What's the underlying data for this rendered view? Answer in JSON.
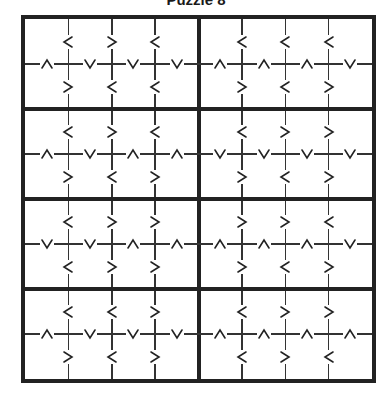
{
  "title": "Puzzle 8",
  "puzzle_type": "greater-than-sudoku",
  "grid": {
    "rows": 8,
    "cols": 8,
    "box_rows": 2,
    "box_cols": 4,
    "line_color": "#333333",
    "border_color": "#222222"
  },
  "boxes": [
    {
      "box": 1,
      "rows": [
        1,
        2
      ],
      "cols": [
        1,
        4
      ],
      "h_top": [
        "<",
        ">",
        "<"
      ],
      "v": [
        "^",
        "v",
        "v",
        "v"
      ],
      "h_bot": [
        ">",
        "<",
        "<"
      ]
    },
    {
      "box": 2,
      "rows": [
        1,
        2
      ],
      "cols": [
        5,
        8
      ],
      "h_top": [
        "<",
        "<",
        "<"
      ],
      "v": [
        "^",
        "^",
        "^",
        "v"
      ],
      "h_bot": [
        ">",
        "<",
        ">"
      ]
    },
    {
      "box": 3,
      "rows": [
        3,
        4
      ],
      "cols": [
        1,
        4
      ],
      "h_top": [
        "<",
        ">",
        "<"
      ],
      "v": [
        "^",
        "v",
        "^",
        "^"
      ],
      "h_bot": [
        ">",
        "<",
        ">"
      ]
    },
    {
      "box": 4,
      "rows": [
        3,
        4
      ],
      "cols": [
        5,
        8
      ],
      "h_top": [
        "<",
        ">",
        ">"
      ],
      "v": [
        "v",
        "v",
        "v",
        "v"
      ],
      "h_bot": [
        ">",
        "<",
        ">"
      ]
    },
    {
      "box": 5,
      "rows": [
        5,
        6
      ],
      "cols": [
        1,
        4
      ],
      "h_top": [
        "<",
        ">",
        ">"
      ],
      "v": [
        "v",
        "v",
        "^",
        "^"
      ],
      "h_bot": [
        "<",
        ">",
        ">"
      ]
    },
    {
      "box": 6,
      "rows": [
        5,
        6
      ],
      "cols": [
        5,
        8
      ],
      "h_top": [
        ">",
        ">",
        "<"
      ],
      "v": [
        "^",
        "^",
        "^",
        "v"
      ],
      "h_bot": [
        ">",
        "<",
        ">"
      ]
    },
    {
      "box": 7,
      "rows": [
        7,
        8
      ],
      "cols": [
        1,
        4
      ],
      "h_top": [
        "<",
        "<",
        ">"
      ],
      "v": [
        "^",
        "v",
        "v",
        "v"
      ],
      "h_bot": [
        ">",
        "<",
        ">"
      ]
    },
    {
      "box": 8,
      "rows": [
        7,
        8
      ],
      "cols": [
        5,
        8
      ],
      "h_top": [
        "<",
        ">",
        ">"
      ],
      "v": [
        "^",
        "^",
        "^",
        "^"
      ],
      "h_bot": [
        "<",
        ">",
        "<"
      ]
    }
  ],
  "cells": {
    "values": [
      [
        "",
        "",
        "",
        "",
        "",
        "",
        "",
        ""
      ],
      [
        "",
        "",
        "",
        "",
        "",
        "",
        "",
        ""
      ],
      [
        "",
        "",
        "",
        "",
        "",
        "",
        "",
        ""
      ],
      [
        "",
        "",
        "",
        "",
        "",
        "",
        "",
        ""
      ],
      [
        "",
        "",
        "",
        "",
        "",
        "",
        "",
        ""
      ],
      [
        "",
        "",
        "",
        "",
        "",
        "",
        "",
        ""
      ],
      [
        "",
        "",
        "",
        "",
        "",
        "",
        "",
        ""
      ],
      [
        "",
        "",
        "",
        "",
        "",
        "",
        "",
        ""
      ]
    ]
  },
  "icons": {
    "<": "less-than-icon",
    ">": "greater-than-icon",
    "^": "up-chevron-icon",
    "v": "down-chevron-icon"
  }
}
